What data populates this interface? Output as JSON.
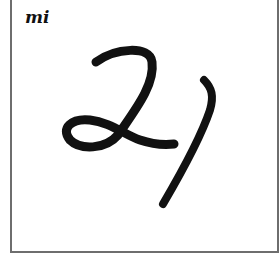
{
  "card": {
    "label": "mi",
    "handwritten_text": "21",
    "ink_color": "#111111",
    "border_color": "#6e6e6e"
  }
}
